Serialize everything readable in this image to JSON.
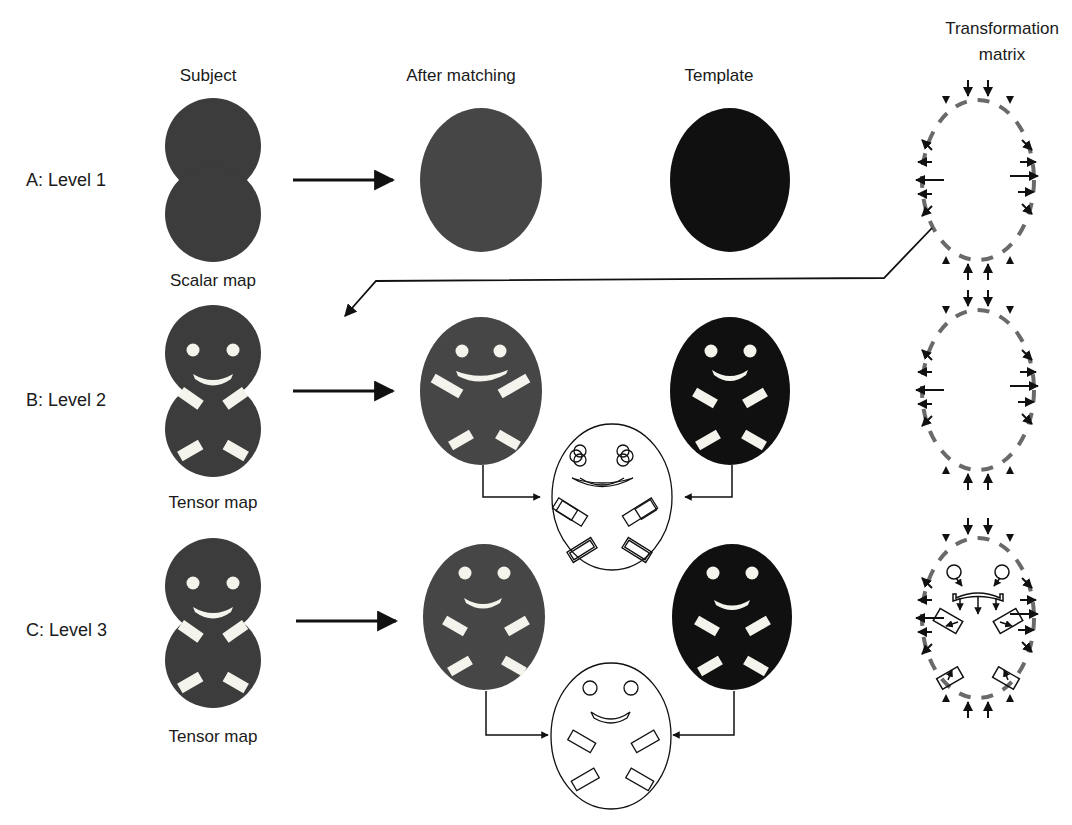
{
  "columns": {
    "subject": "Subject",
    "after_matching": "After matching",
    "template": "Template",
    "transformation_line1": "Transformation",
    "transformation_line2": "matrix"
  },
  "rows": [
    {
      "id": "A",
      "label": "A: Level 1",
      "subject_caption": "Scalar map"
    },
    {
      "id": "B",
      "label": "B: Level 2",
      "subject_caption": "Tensor map"
    },
    {
      "id": "C",
      "label": "C: Level 3",
      "subject_caption": "Tensor map"
    }
  ],
  "colors": {
    "subject_fill": "#3c3c3c",
    "matched_fill": "#464646",
    "template_fill": "#101010",
    "feature_fill": "#f4f4ec",
    "dashed_outline": "#6a6a6a",
    "arrow": "#111111"
  }
}
